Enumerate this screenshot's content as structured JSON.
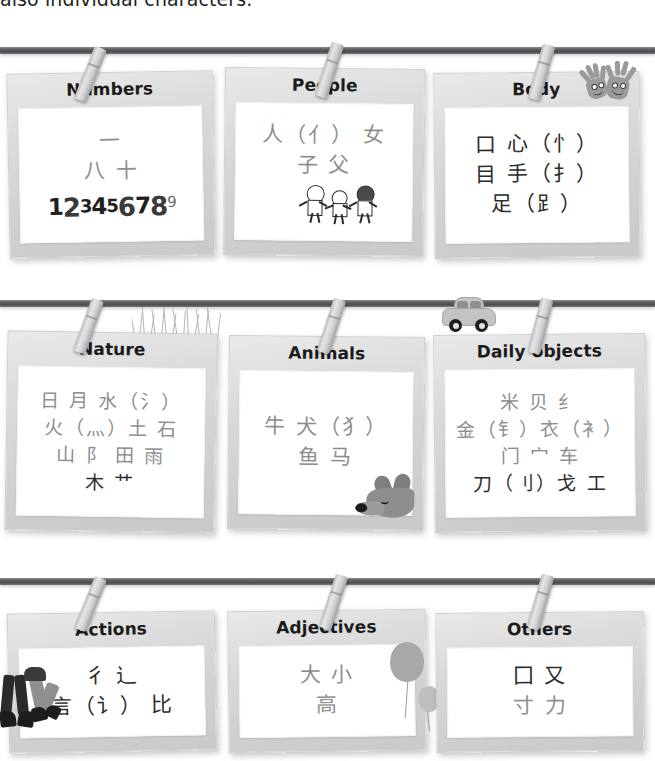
{
  "page": {
    "top_cut_text": "also individual characters."
  },
  "board": {
    "rows": [
      {
        "wire_label": "washing-line-1",
        "cards": [
          {
            "title": "Numbers",
            "lines": [
              "一",
              "八  十"
            ],
            "extra_number_strip": [
              "1",
              "2",
              "3",
              "4",
              "5",
              "6",
              "7",
              "8",
              "9"
            ],
            "decoration": "numbers-doodle"
          },
          {
            "title": "People",
            "lines": [
              "人（亻）  女",
              "子  父"
            ],
            "decoration": "children-illustration"
          },
          {
            "title": "Body",
            "lines": [
              "口  心（忄）",
              "目  手（扌）",
              "足（⻊）"
            ],
            "decoration": "waving-hands-illustration"
          }
        ]
      },
      {
        "wire_label": "washing-line-2",
        "cards": [
          {
            "title": "Nature",
            "lines": [
              "日  月  水（氵）",
              "火（灬）土  石",
              "山  阝  田  雨",
              "木   艹"
            ],
            "decoration": "grass-illustration"
          },
          {
            "title": "Animals",
            "lines": [
              "牛  犬（犭）",
              "鱼  马"
            ],
            "decoration": "fox-illustration"
          },
          {
            "title": "Daily objects",
            "lines": [
              "米  贝  纟",
              "金（钅）衣（衤）",
              "门  宀  车",
              "刀（刂）戈  工"
            ],
            "decoration": "car-illustration"
          }
        ]
      },
      {
        "wire_label": "washing-line-3",
        "cards": [
          {
            "title": "Actions",
            "lines": [
              "彳  辶",
              "言（讠）  比"
            ],
            "decoration": "dancing-legs-illustration"
          },
          {
            "title": "Adjectives",
            "lines": [
              "大  小",
              "高"
            ],
            "decoration": "balloons-illustration"
          },
          {
            "title": "Others",
            "lines": [
              "囗  又",
              "寸  力"
            ],
            "decoration": "none"
          }
        ]
      }
    ]
  },
  "colors": {
    "wire": "#54565a",
    "card_face": "#d8d8d8",
    "sheet": "#ffffff",
    "glyph": "#8e8e8e",
    "glyph_dark": "#2c2c2c",
    "title": "#1b1b1b",
    "peg": "#c8cacc"
  }
}
